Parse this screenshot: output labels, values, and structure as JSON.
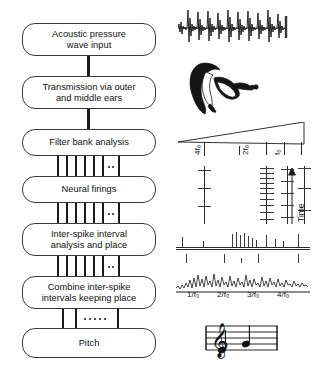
{
  "figure": {
    "type": "flowchart-with-signal-illustrations"
  },
  "flowchart": {
    "boxes": [
      {
        "id": "acoustic-input",
        "label": "Acoustic pressure wave input",
        "line1": "Acoustic pressure",
        "line2": "wave input",
        "x": 22,
        "y": 23,
        "w": 134,
        "h": 33
      },
      {
        "id": "transmission",
        "label": "Transmission via outer and middle ears",
        "line1": "Transmission via outer",
        "line2": "and middle ears",
        "x": 22,
        "y": 76,
        "w": 134,
        "h": 33
      },
      {
        "id": "filter-bank",
        "label": "Filter bank analysis",
        "line1": "Filter bank analysis",
        "line2": "",
        "x": 22,
        "y": 129,
        "w": 134,
        "h": 27
      },
      {
        "id": "neural-firings",
        "label": "Neural firings",
        "line1": "Neural firings",
        "line2": "",
        "x": 22,
        "y": 176,
        "w": 134,
        "h": 27
      },
      {
        "id": "isi-analysis",
        "label": "Inter-spike interval analysis and place",
        "line1": "Inter-spike interval",
        "line2": "analysis and place",
        "x": 22,
        "y": 223,
        "w": 134,
        "h": 33
      },
      {
        "id": "combine-isi",
        "label": "Combine inter-spike intervals keeping place",
        "line1": "Combine inter-spike",
        "line2": "intervals keeping place",
        "x": 22,
        "y": 276,
        "w": 134,
        "h": 33
      },
      {
        "id": "pitch",
        "label": "Pitch",
        "line1": "Pitch",
        "line2": "",
        "x": 22,
        "y": 328,
        "w": 134,
        "h": 30
      }
    ],
    "connectors": [
      {
        "id": "conn-1",
        "kind": "single-line",
        "from": "acoustic-input",
        "to": "transmission",
        "x": 88,
        "y": 56,
        "h": 20
      },
      {
        "id": "conn-2",
        "kind": "single-line",
        "from": "transmission",
        "to": "filter-bank",
        "x": 88,
        "y": 109,
        "h": 20
      },
      {
        "id": "conn-3",
        "kind": "multi-channel",
        "from": "filter-bank",
        "to": "neural-firings",
        "x": 57,
        "y": 156,
        "w": 62,
        "h": 20,
        "bars": 7,
        "dashed_gap": true
      },
      {
        "id": "conn-4",
        "kind": "multi-channel",
        "from": "neural-firings",
        "to": "isi-analysis",
        "x": 57,
        "y": 203,
        "w": 62,
        "h": 20,
        "bars": 7,
        "dashed_gap": true
      },
      {
        "id": "conn-5",
        "kind": "multi-channel",
        "from": "isi-analysis",
        "to": "combine-isi",
        "x": 57,
        "y": 256,
        "w": 62,
        "h": 20,
        "bars": 7,
        "dashed_gap": true
      },
      {
        "id": "conn-6",
        "kind": "multi-channel-sparse",
        "from": "combine-isi",
        "to": "pitch",
        "x": 62,
        "y": 309,
        "w": 56,
        "h": 19,
        "bars": 3,
        "dashed_gap": true
      }
    ]
  },
  "illustrations": {
    "waveform": {
      "id": "acoustic-waveform",
      "description": "Periodic speech pressure waveform with repeating pitch pulses",
      "pulses": 7
    },
    "ear": {
      "id": "ear-anatomy",
      "description": "Outer ear, middle ear and cochlea cross-section drawing"
    },
    "filterbank": {
      "id": "filter-bank-triangle",
      "description": "Wedge representing a bank of band-pass filters, widest at low frequency",
      "channel_labels": [
        "4f₀",
        "2f₀",
        "f₀"
      ]
    },
    "spiketrains": {
      "id": "neural-spike-trains",
      "description": "Inter-spike interval histograms per filter channel",
      "axis_label": "Time",
      "axis_arrow": "up"
    },
    "autocorrelogram": {
      "id": "summary-autocorrelogram",
      "description": "Summary autocorrelation function with peaks at multiples of the pitch period",
      "xticks": [
        "1/f₀",
        "2/f₀",
        "3/f₀",
        "4/f₀"
      ]
    },
    "score": {
      "id": "musical-staff",
      "description": "Treble clef staff showing two pitched notes",
      "clef": "𝄞",
      "notes": 2
    }
  },
  "colors": {
    "ink": "#1b1b1b",
    "box_stroke": "#3a3a3a",
    "background": "#ffffff",
    "signal": "#222222"
  }
}
